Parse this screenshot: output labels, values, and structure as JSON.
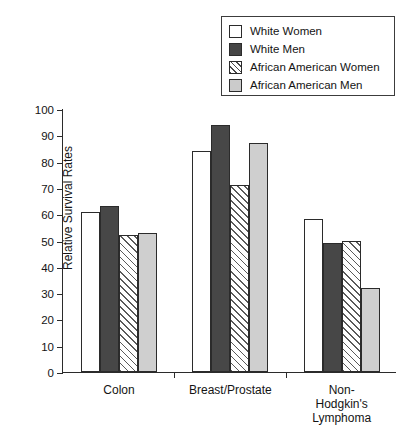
{
  "chart_data": {
    "type": "bar",
    "title": "",
    "xlabel": "",
    "ylabel": "Relative Survival Rates",
    "ylim": [
      0,
      100
    ],
    "yticks": [
      0,
      10,
      20,
      30,
      40,
      50,
      60,
      70,
      80,
      90,
      100
    ],
    "grid": false,
    "legend_position": "top-right",
    "categories": [
      "Colon",
      "Breast/Prostate",
      "Non-Hodgkin's\nLymphoma"
    ],
    "series": [
      {
        "name": "White Women",
        "style": "white",
        "color": "#ffffff",
        "values": [
          61,
          84,
          58
        ]
      },
      {
        "name": "White Men",
        "style": "solid-dark",
        "color": "#474747",
        "values": [
          63,
          94,
          49
        ]
      },
      {
        "name": "African American Women",
        "style": "hatched",
        "color": "#ffffff",
        "values": [
          52,
          71,
          50
        ]
      },
      {
        "name": "African American Men",
        "style": "light-gray",
        "color": "#cfcfcf",
        "values": [
          53,
          87,
          32
        ]
      }
    ]
  },
  "legend": {
    "items": [
      {
        "label": "White Women",
        "swatch": "legend-swatch-white"
      },
      {
        "label": "White Men",
        "swatch": "legend-swatch-dark"
      },
      {
        "label": "African American Women",
        "swatch": "legend-swatch-hatched"
      },
      {
        "label": "African American Men",
        "swatch": "legend-swatch-gray"
      }
    ]
  },
  "axes": {
    "y_title": "Relative Survival Rates",
    "y_tick_labels": [
      "100",
      "90",
      "80",
      "70",
      "60",
      "50",
      "40",
      "30",
      "20",
      "10",
      "0"
    ],
    "x_tick_labels": [
      "Colon",
      "Breast/Prostate",
      "Non-Hodgkin's\nLymphoma"
    ]
  }
}
